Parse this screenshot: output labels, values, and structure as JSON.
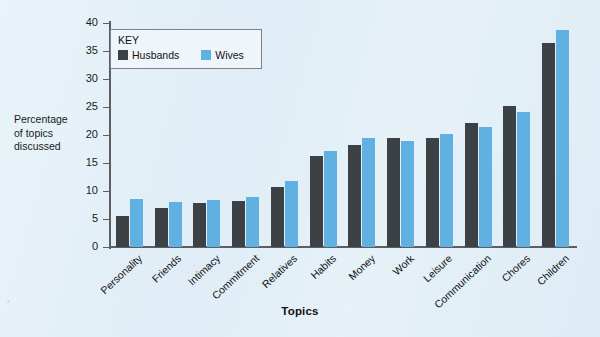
{
  "chart_data": {
    "type": "bar",
    "title": "",
    "xlabel": "Topics",
    "ylabel": "Percentage of topics discussed",
    "ylabel_lines": [
      "Percentage",
      "of topics",
      "discussed"
    ],
    "ylim": [
      0,
      40
    ],
    "ytick_step": 5,
    "yticks": [
      0,
      5,
      10,
      15,
      20,
      25,
      30,
      35,
      40
    ],
    "ytick_labels": [
      "0",
      "5",
      "10",
      "15",
      "20",
      "25",
      "30",
      "35",
      "40"
    ],
    "grid": false,
    "legend_position": "top-left",
    "legend_title": "KEY",
    "categories": [
      "Personality",
      "Friends",
      "Intimacy",
      "Commitment",
      "Relatives",
      "Habits",
      "Money",
      "Work",
      "Leisure",
      "Communication",
      "Chores",
      "Children"
    ],
    "series": [
      {
        "name": "Husbands",
        "color": "#3b4145",
        "values": [
          5.5,
          7.0,
          7.8,
          8.2,
          10.7,
          16.3,
          18.3,
          19.4,
          19.5,
          22.1,
          25.2,
          36.4
        ]
      },
      {
        "name": "Wives",
        "color": "#61b0e2",
        "values": [
          8.5,
          8.0,
          8.4,
          9.0,
          11.8,
          17.2,
          19.4,
          18.9,
          20.2,
          21.5,
          24.1,
          38.7
        ]
      }
    ]
  },
  "legend": {
    "title": "KEY",
    "entries": [
      {
        "label": "Husbands",
        "color": "#3b4145"
      },
      {
        "label": "Wives",
        "color": "#61b0e2"
      }
    ]
  },
  "axes": {
    "x_title": "Topics",
    "y_title_lines": [
      "Percentage",
      "of topics",
      "discussed"
    ]
  },
  "colors": {
    "background": "#e4f0f7",
    "husbands": "#3b4145",
    "wives": "#61b0e2",
    "axis": "#5b5f63",
    "text": "#111111"
  }
}
